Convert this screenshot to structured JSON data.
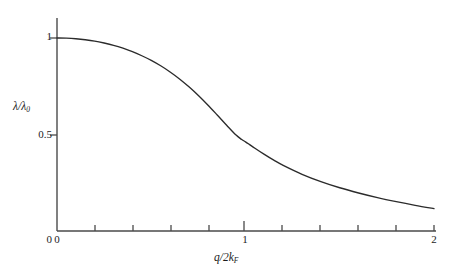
{
  "chart": {
    "y_axis_title_html": "&lambda;/&lambda;<sub>0</sub>",
    "x_axis_title_html": "q/2k<sub>F</sub>",
    "y_tick_labels": [
      "1",
      "0.5",
      "0"
    ],
    "x_tick_labels": [
      "0",
      "1",
      "2"
    ],
    "line_color": "#2b2b2b",
    "axis_color": "#4a4a4a",
    "background_color": "#ffffff"
  },
  "chart_data": {
    "type": "line",
    "title": "",
    "subtitle": "",
    "xlabel": "q/2k_F",
    "ylabel": "lambda/lambda_0",
    "xlim": [
      0,
      2
    ],
    "ylim": [
      0,
      1
    ],
    "grid": false,
    "legend": null,
    "x_ticks": [
      0,
      0.2,
      0.4,
      0.6,
      0.8,
      1.0,
      1.2,
      1.4,
      1.6,
      1.8,
      2.0
    ],
    "x_tick_labels_shown": {
      "0": "0",
      "1": "1",
      "2": "2"
    },
    "y_ticks": [
      0,
      0.5,
      1.0
    ],
    "y_tick_labels_shown": {
      "0": "0",
      "0.5": "0.5",
      "1": "1"
    },
    "series": [
      {
        "name": "Thomas-Fermi / Lindhard screening ratio",
        "x": [
          0.0,
          0.05,
          0.1,
          0.15,
          0.2,
          0.25,
          0.3,
          0.35,
          0.4,
          0.45,
          0.5,
          0.55,
          0.6,
          0.65,
          0.7,
          0.75,
          0.8,
          0.85,
          0.9,
          0.95,
          0.98,
          1.0,
          1.02,
          1.05,
          1.1,
          1.15,
          1.2,
          1.3,
          1.4,
          1.5,
          1.6,
          1.7,
          1.8,
          1.9,
          2.0
        ],
        "y": [
          1.0,
          0.999,
          0.996,
          0.991,
          0.984,
          0.974,
          0.962,
          0.947,
          0.929,
          0.908,
          0.884,
          0.856,
          0.824,
          0.788,
          0.747,
          0.702,
          0.653,
          0.601,
          0.548,
          0.497,
          0.474,
          0.462,
          0.449,
          0.429,
          0.397,
          0.367,
          0.34,
          0.294,
          0.256,
          0.224,
          0.197,
          0.173,
          0.152,
          0.133,
          0.116
        ]
      }
    ],
    "annotations": []
  }
}
